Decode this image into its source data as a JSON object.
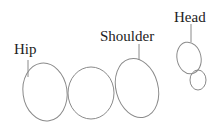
{
  "labels": {
    "hip": "Hip",
    "shoulder": "Shoulder",
    "head": "Head"
  },
  "colors": {
    "stroke": "#8a8a8a",
    "text": "#222222",
    "background": "#ffffff"
  }
}
